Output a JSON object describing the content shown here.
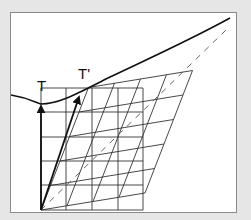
{
  "diagram": {
    "labels": {
      "tangent": "T",
      "tangent_prime": "T'"
    },
    "colors": {
      "background": "#e6e6e6",
      "panel": "#ffffff",
      "stroke": "#222222",
      "grid": "#333333",
      "dashed": "#555555"
    }
  }
}
